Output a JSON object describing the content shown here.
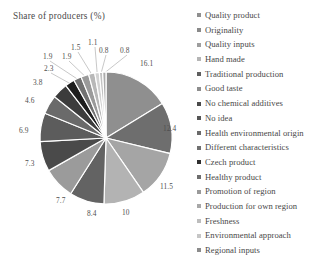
{
  "chart_data": {
    "type": "pie",
    "title": "Share of producers (%)",
    "xlabel": "",
    "ylabel": "",
    "legend_position": "right",
    "grid": false,
    "units": "%",
    "categories": [
      "Quality product",
      "Originality",
      "Quality inputs",
      "Hand made",
      "Traditional production",
      "Good taste",
      "No chemical additives",
      "No idea",
      "Health environmental origin",
      "Different characteristics",
      "Czech product",
      "Healthy product",
      "Promotion of region",
      "Production for own region",
      "Freshness",
      "Environmental approach",
      "Regional inputs"
    ],
    "values": [
      16.1,
      12.4,
      11.5,
      10,
      8.4,
      7.7,
      7.3,
      6.9,
      4.6,
      3.8,
      2.3,
      1.9,
      1.9,
      1.5,
      1.1,
      0.8,
      0.8
    ],
    "slice_colors": [
      "#8f8f8f",
      "#6e6e6e",
      "#a5a5a5",
      "#b3b3b3",
      "#636363",
      "#9b9b9b",
      "#4a4a4a",
      "#5c5c5c",
      "#6a6a6a",
      "#3c3c3c",
      "#1e1e1e",
      "#717171",
      "#9a9a9a",
      "#b8b8b8",
      "#d2d2d2",
      "#c2c2c2",
      "#ababab"
    ],
    "labels": [
      {
        "value": "16.1",
        "x": 140,
        "y": 59
      },
      {
        "value": "12.4",
        "x": 163,
        "y": 124
      },
      {
        "value": "11.5",
        "x": 160,
        "y": 182
      },
      {
        "value": "10",
        "x": 122,
        "y": 208
      },
      {
        "value": "8.4",
        "x": 87,
        "y": 209
      },
      {
        "value": "7.7",
        "x": 56,
        "y": 196
      },
      {
        "value": "7.3",
        "x": 25,
        "y": 159
      },
      {
        "value": "6.9",
        "x": 19,
        "y": 126
      },
      {
        "value": "4.6",
        "x": 25,
        "y": 96
      },
      {
        "value": "3.8",
        "x": 33,
        "y": 78
      },
      {
        "value": "2.3",
        "x": 44,
        "y": 64
      },
      {
        "value": "1.9",
        "x": 43,
        "y": 52
      },
      {
        "value": "1.9",
        "x": 62,
        "y": 52
      },
      {
        "value": "1.5",
        "x": 71,
        "y": 43
      },
      {
        "value": "1.1",
        "x": 88,
        "y": 38
      },
      {
        "value": "0.8",
        "x": 99,
        "y": 46
      },
      {
        "value": "0.8",
        "x": 120,
        "y": 46
      }
    ],
    "legend_entries": [
      {
        "label": "Quality product",
        "color": "#8f8f8f"
      },
      {
        "label": "Originality",
        "color": "#8a8a8a"
      },
      {
        "label": "Quality inputs",
        "color": "#9e9e9e"
      },
      {
        "label": "Hand made",
        "color": "#b5b5b5"
      },
      {
        "label": "Traditional production",
        "color": "#5f5f5f"
      },
      {
        "label": "Good taste",
        "color": "#8d8d8d"
      },
      {
        "label": "No chemical additives",
        "color": "#4a4a4a"
      },
      {
        "label": "No idea",
        "color": "#555555"
      },
      {
        "label": "Health environmental origin",
        "color": "#6a6a6a"
      },
      {
        "label": "Different characteristics",
        "color": "#707070"
      },
      {
        "label": "Czech product",
        "color": "#2e2e2e"
      },
      {
        "label": "Healthy product",
        "color": "#6d6d6d"
      },
      {
        "label": "Promotion of region",
        "color": "#9a9a9a"
      },
      {
        "label": "Production for own region",
        "color": "#a8a8a8"
      },
      {
        "label": "Freshness",
        "color": "#bdbdbd"
      },
      {
        "label": "Environmental approach",
        "color": "#c6c6c6"
      },
      {
        "label": "Regional inputs",
        "color": "#8c8c8c"
      }
    ],
    "geometry": {
      "cx": 106,
      "cy": 138,
      "r": 66,
      "start_angle_deg": -90,
      "direction": "clockwise"
    }
  }
}
